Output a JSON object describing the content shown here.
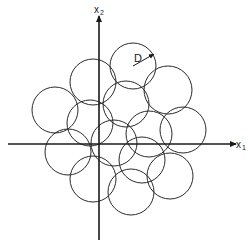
{
  "diagram": {
    "type": "circle-packing-coverage",
    "axes": {
      "x_label": "x",
      "x_subscript": "1",
      "y_label": "x",
      "y_subscript": "2"
    },
    "radius_label": "D",
    "circle_count": 14
  },
  "colors": {
    "stroke": "#2a2a2a",
    "axis": "#1a1a1a",
    "background": "#ffffff"
  }
}
